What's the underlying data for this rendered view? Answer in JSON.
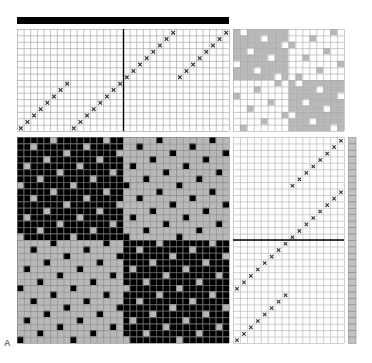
{
  "figure_label": "A",
  "colors": {
    "black": "#000000",
    "gray": "#b8b8b8",
    "grid_line": "#9a9a9a",
    "white": "#ffffff",
    "strip": "#c2c2c2"
  },
  "threading": {
    "columns": 32,
    "rows": 16,
    "marks": [
      [
        0,
        15
      ],
      [
        1,
        14
      ],
      [
        2,
        13
      ],
      [
        3,
        12
      ],
      [
        4,
        11
      ],
      [
        5,
        10
      ],
      [
        6,
        9
      ],
      [
        7,
        8
      ],
      [
        8,
        15
      ],
      [
        9,
        14
      ],
      [
        10,
        13
      ],
      [
        11,
        12
      ],
      [
        12,
        11
      ],
      [
        13,
        10
      ],
      [
        14,
        9
      ],
      [
        15,
        8
      ],
      [
        16,
        7
      ],
      [
        17,
        6
      ],
      [
        18,
        5
      ],
      [
        19,
        4
      ],
      [
        20,
        3
      ],
      [
        21,
        2
      ],
      [
        22,
        1
      ],
      [
        23,
        0
      ],
      [
        24,
        7
      ],
      [
        25,
        6
      ],
      [
        26,
        5
      ],
      [
        27,
        4
      ],
      [
        28,
        3
      ],
      [
        29,
        2
      ],
      [
        30,
        1
      ],
      [
        31,
        0
      ]
    ]
  },
  "tieup": {
    "size": 16,
    "exceptions_top_left_white": [
      [
        0,
        1
      ],
      [
        1,
        4
      ],
      [
        2,
        7
      ],
      [
        3,
        2
      ],
      [
        4,
        5
      ],
      [
        5,
        0
      ],
      [
        6,
        3
      ],
      [
        7,
        6
      ]
    ],
    "exceptions_top_right_gray": [
      [
        0,
        14
      ],
      [
        1,
        11
      ],
      [
        2,
        8
      ],
      [
        3,
        13
      ],
      [
        4,
        10
      ],
      [
        5,
        15
      ],
      [
        6,
        12
      ],
      [
        7,
        9
      ]
    ],
    "exceptions_bottom_left_gray": [
      [
        8,
        6
      ],
      [
        9,
        3
      ],
      [
        10,
        0
      ],
      [
        11,
        5
      ],
      [
        12,
        2
      ],
      [
        13,
        7
      ],
      [
        14,
        4
      ],
      [
        15,
        1
      ]
    ],
    "exceptions_bottom_right_white": [
      [
        8,
        9
      ],
      [
        9,
        12
      ],
      [
        10,
        15
      ],
      [
        11,
        10
      ],
      [
        12,
        13
      ],
      [
        13,
        8
      ],
      [
        14,
        11
      ],
      [
        15,
        14
      ]
    ]
  },
  "drawdown": {
    "columns": 32,
    "rows": 32,
    "spot_offsets": [
      5,
      2,
      7,
      4,
      1,
      6,
      3,
      0
    ]
  },
  "treadling": {
    "columns": 16,
    "rows": 32,
    "divider_after_row": 16,
    "marks": [
      [
        15,
        0
      ],
      [
        14,
        1
      ],
      [
        13,
        2
      ],
      [
        12,
        3
      ],
      [
        11,
        4
      ],
      [
        10,
        5
      ],
      [
        9,
        6
      ],
      [
        8,
        7
      ],
      [
        15,
        8
      ],
      [
        14,
        9
      ],
      [
        13,
        10
      ],
      [
        12,
        11
      ],
      [
        11,
        12
      ],
      [
        10,
        13
      ],
      [
        9,
        14
      ],
      [
        8,
        15
      ],
      [
        7,
        16
      ],
      [
        6,
        17
      ],
      [
        5,
        18
      ],
      [
        4,
        19
      ],
      [
        3,
        20
      ],
      [
        2,
        21
      ],
      [
        1,
        22
      ],
      [
        0,
        23
      ],
      [
        7,
        24
      ],
      [
        6,
        25
      ],
      [
        5,
        26
      ],
      [
        4,
        27
      ],
      [
        3,
        28
      ],
      [
        2,
        29
      ],
      [
        1,
        30
      ],
      [
        0,
        31
      ]
    ]
  },
  "strip": {
    "cells": 32
  }
}
